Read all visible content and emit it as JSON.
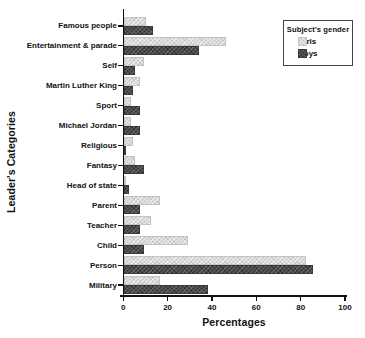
{
  "chart_data": {
    "type": "bar",
    "orientation": "horizontal",
    "xlabel": "Percentages",
    "ylabel": "Leader's Categories",
    "xlim": [
      0,
      100
    ],
    "xticks": [
      0,
      20,
      40,
      60,
      80,
      100
    ],
    "grid": false,
    "categories": [
      "Famous people",
      "Entertainment & parade",
      "Self",
      "Martin Luther King",
      "Sport",
      "Michael Jordan",
      "Religious",
      "Fantasy",
      "Head of state",
      "Parent",
      "Teacher",
      "Child",
      "Person",
      "Military"
    ],
    "series": [
      {
        "name": "Girls",
        "color": "#d9d9d9",
        "values": [
          10,
          46,
          9,
          7,
          3,
          3,
          4,
          5,
          1,
          16,
          12,
          29,
          82,
          16
        ]
      },
      {
        "name": "Boys",
        "color": "#4a4a4a",
        "values": [
          13,
          34,
          5,
          4,
          7,
          7,
          1,
          9,
          2,
          7,
          7,
          9,
          85,
          38
        ]
      }
    ],
    "legend": {
      "title": "Subject's gender",
      "position": "top-right"
    },
    "colors": {
      "axis": "#111111",
      "text": "#111111",
      "background": "#ffffff"
    }
  }
}
